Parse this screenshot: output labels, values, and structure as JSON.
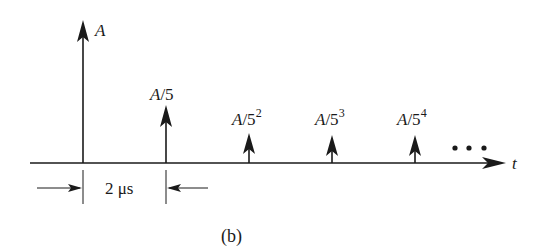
{
  "figure": {
    "caption": "(b)",
    "axis_label": "t",
    "continuation": "•••",
    "spacing_label_num": "2 ",
    "spacing_label_unit": "μs",
    "colors": {
      "ink": "#1a1a1a",
      "background": "#ffffff"
    }
  },
  "impulses": [
    {
      "label_base": "A",
      "label_den": "",
      "label_exp": "",
      "x": 83,
      "tip_y": 20
    },
    {
      "label_base": "A",
      "label_den": "/5",
      "label_exp": "",
      "x": 166,
      "tip_y": 105
    },
    {
      "label_base": "A",
      "label_den": "/5",
      "label_exp": "2",
      "x": 249,
      "tip_y": 132
    },
    {
      "label_base": "A",
      "label_den": "/5",
      "label_exp": "3",
      "x": 332,
      "tip_y": 135
    },
    {
      "label_base": "A",
      "label_den": "/5",
      "label_exp": "4",
      "x": 415,
      "tip_y": 135
    }
  ]
}
